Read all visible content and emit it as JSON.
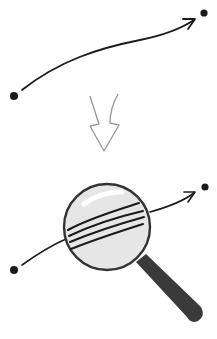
{
  "diagram": {
    "colors": {
      "background": "#ffffff",
      "stroke": "#1a1a1a",
      "arrow_outline": "#9a9a9a",
      "lens_fill": "#e6e6e6",
      "lens_rim": "#333333",
      "handle": "#3a3a3a",
      "highlight": "#ffffff"
    },
    "top_path": {
      "start_point": [
        14,
        96
      ],
      "end_point": [
        204,
        13
      ]
    },
    "transition_arrow": {
      "direction": "down",
      "style": "hollow"
    },
    "bottom_path": {
      "start_point": [
        14,
        270
      ],
      "end_point": [
        205,
        187
      ],
      "magnifier": {
        "center": [
          107,
          236
        ],
        "radius": 43,
        "strand_count": 4
      }
    }
  }
}
